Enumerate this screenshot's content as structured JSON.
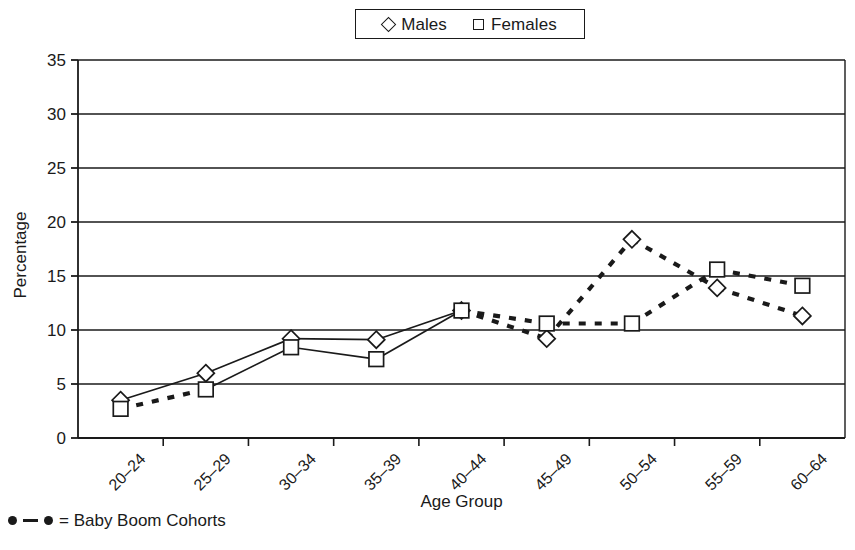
{
  "legend": {
    "entries": [
      {
        "label": "Males",
        "marker": "diamond-marker"
      },
      {
        "label": "Females",
        "marker": "square-marker"
      }
    ]
  },
  "footnote": {
    "text": "= Baby Boom Cohorts",
    "marker": "dot-line-dot-icon"
  },
  "chart_data": {
    "type": "line",
    "title": "",
    "xlabel": "Age Group",
    "ylabel": "Percentage",
    "categories": [
      "20–24",
      "25–29",
      "30–34",
      "35–39",
      "40–44",
      "45–49",
      "50–54",
      "55–59",
      "60–64"
    ],
    "series": [
      {
        "name": "Males",
        "marker": "diamond",
        "values": [
          3.5,
          6.0,
          9.2,
          9.1,
          11.8,
          9.2,
          18.4,
          13.9,
          11.3
        ]
      },
      {
        "name": "Females",
        "marker": "square",
        "values": [
          2.7,
          4.5,
          8.4,
          7.3,
          11.8,
          10.6,
          10.6,
          15.6,
          14.1
        ]
      }
    ],
    "ylim": [
      0,
      35
    ],
    "yticks": [
      0,
      5,
      10,
      15,
      20,
      25,
      30,
      35
    ],
    "grid": true,
    "legend_position": "top-center",
    "baby_boom_cohorts_segments": [
      {
        "series": "Males",
        "from_index": 4,
        "to_index": 8
      },
      {
        "series": "Females",
        "from_index": 0,
        "to_index": 1
      },
      {
        "series": "Females",
        "from_index": 4,
        "to_index": 8
      }
    ],
    "line_style_note": "solid = non baby boom, dashed = baby boom cohorts"
  },
  "colors": {
    "line": "#1a1a1a",
    "grid": "#1a1a1a",
    "background": "#ffffff"
  }
}
